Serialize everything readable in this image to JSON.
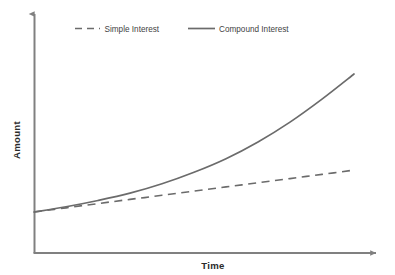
{
  "chart_data": {
    "type": "line",
    "title": "",
    "xlabel": "Time",
    "ylabel": "Amount",
    "grid": false,
    "legend_position": "top",
    "axis_style": "arrow-axes-no-ticks",
    "xlim": [
      0,
      100
    ],
    "ylim": [
      0,
      100
    ],
    "x": [
      0,
      10,
      20,
      30,
      40,
      50,
      60,
      70,
      80,
      90,
      100
    ],
    "series": [
      {
        "name": "Simple Interest",
        "style": "dashed",
        "color": "#6b6b6b",
        "values": [
          17,
          19,
          21,
          23,
          25,
          27,
          29,
          31,
          33,
          35,
          37
        ]
      },
      {
        "name": "Compound Interest",
        "style": "solid",
        "color": "#6b6b6b",
        "values": [
          17,
          19.5,
          22.5,
          26,
          30.5,
          36,
          42.5,
          50.5,
          60,
          71,
          83
        ]
      }
    ]
  },
  "legend": {
    "items": [
      {
        "label": "Simple Interest",
        "style": "dashed"
      },
      {
        "label": "Compound Interest",
        "style": "solid"
      }
    ]
  },
  "axes": {
    "y_label": "Amount",
    "x_label": "Time"
  },
  "colors": {
    "line": "#6b6b6b",
    "axis": "#808080",
    "text": "#2b2b2b",
    "legend_text": "#3f3f3f",
    "background": "#ffffff"
  }
}
